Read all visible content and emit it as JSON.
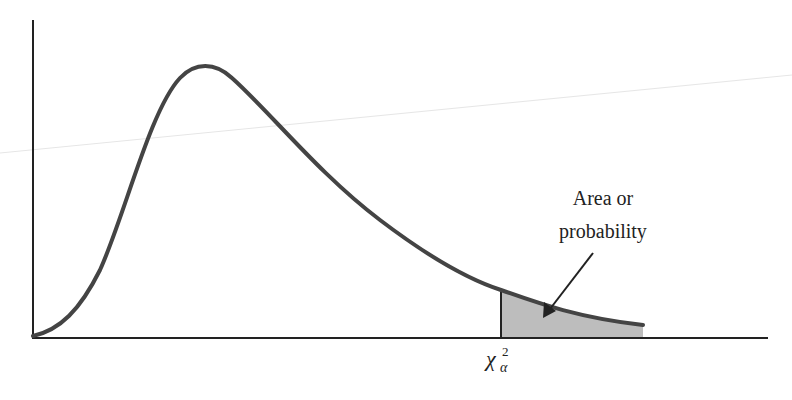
{
  "figure": {
    "annotation": {
      "line1": "Area or",
      "line2": "probability"
    },
    "critical_value": {
      "symbol": "χ",
      "subscript": "α",
      "superscript": "2"
    },
    "colors": {
      "curve": "#444444",
      "axes": "#222222",
      "shade": "#bdbdbd"
    }
  }
}
